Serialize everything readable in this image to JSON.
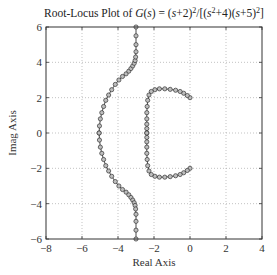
{
  "chart_data": {
    "type": "line",
    "title_parts": {
      "prefix": "Root-Locus Plot of ",
      "func": "G",
      "arg": "(s)",
      "eq": " = (",
      "s1": "s",
      "n1": "+2)",
      "sup1": "2",
      "mid": "/[(",
      "s2": "s",
      "sup2": "2",
      "n2": "+4)(",
      "s3": "s",
      "n3": "+5)",
      "sup3": "2",
      "end": "]"
    },
    "xlabel": "Real Axis",
    "ylabel": "Imag Axis",
    "xlim": [
      -8,
      4
    ],
    "ylim": [
      -6,
      6
    ],
    "xticks": [
      -8,
      -6,
      -4,
      -2,
      0,
      2,
      4
    ],
    "yticks": [
      -6,
      -4,
      -2,
      0,
      2,
      4,
      6
    ],
    "grid": true,
    "legend": null,
    "series": [
      {
        "name": "branch-left-upper",
        "x": [
          -5.05,
          -5.03,
          -4.98,
          -4.9,
          -4.8,
          -4.68,
          -4.52,
          -4.35,
          -4.15,
          -3.95,
          -3.75,
          -3.55,
          -3.4,
          -3.28,
          -3.18,
          -3.1,
          -3.05,
          -3.02,
          -3.0,
          -3.0,
          -3.0,
          -3.0
        ],
        "y": [
          0.0,
          0.4,
          0.8,
          1.15,
          1.5,
          1.85,
          2.15,
          2.45,
          2.75,
          3.0,
          3.2,
          3.35,
          3.5,
          3.65,
          3.8,
          3.95,
          4.1,
          4.3,
          4.6,
          5.0,
          5.5,
          6.0
        ]
      },
      {
        "name": "branch-left-lower",
        "x": [
          -5.05,
          -5.03,
          -4.98,
          -4.9,
          -4.8,
          -4.68,
          -4.52,
          -4.35,
          -4.15,
          -3.95,
          -3.75,
          -3.55,
          -3.4,
          -3.28,
          -3.18,
          -3.1,
          -3.05,
          -3.02,
          -3.0,
          -3.0,
          -3.0,
          -3.0
        ],
        "y": [
          0.0,
          -0.4,
          -0.8,
          -1.15,
          -1.5,
          -1.85,
          -2.15,
          -2.45,
          -2.75,
          -3.0,
          -3.2,
          -3.35,
          -3.5,
          -3.65,
          -3.8,
          -3.95,
          -4.1,
          -4.3,
          -4.6,
          -5.0,
          -5.5,
          -6.0
        ]
      },
      {
        "name": "branch-right-upper",
        "x": [
          0.0,
          -0.15,
          -0.35,
          -0.55,
          -0.8,
          -1.1,
          -1.4,
          -1.7,
          -1.95,
          -2.15,
          -2.28,
          -2.35,
          -2.38,
          -2.4,
          -2.4,
          -2.4,
          -2.4,
          -2.4
        ],
        "y": [
          2.0,
          2.12,
          2.25,
          2.35,
          2.42,
          2.47,
          2.5,
          2.5,
          2.45,
          2.35,
          2.15,
          1.85,
          1.5,
          1.15,
          0.8,
          0.5,
          0.25,
          0.0
        ]
      },
      {
        "name": "branch-right-lower",
        "x": [
          0.0,
          -0.15,
          -0.35,
          -0.55,
          -0.8,
          -1.1,
          -1.4,
          -1.7,
          -1.95,
          -2.15,
          -2.28,
          -2.35,
          -2.38,
          -2.4,
          -2.4,
          -2.4,
          -2.4,
          -2.4
        ],
        "y": [
          -2.0,
          -2.12,
          -2.25,
          -2.35,
          -2.42,
          -2.47,
          -2.5,
          -2.5,
          -2.45,
          -2.35,
          -2.15,
          -1.85,
          -1.5,
          -1.15,
          -0.8,
          -0.5,
          -0.25,
          0.0
        ]
      }
    ],
    "poles": [
      [
        0,
        2
      ],
      [
        0,
        -2
      ],
      [
        -5,
        0
      ],
      [
        -5,
        0
      ]
    ],
    "zeros": [
      [
        -2,
        0
      ],
      [
        -2,
        0
      ]
    ],
    "asymptote_x": -3
  },
  "plot_box": {
    "left": 46,
    "top": 27,
    "right": 262,
    "bottom": 239
  }
}
